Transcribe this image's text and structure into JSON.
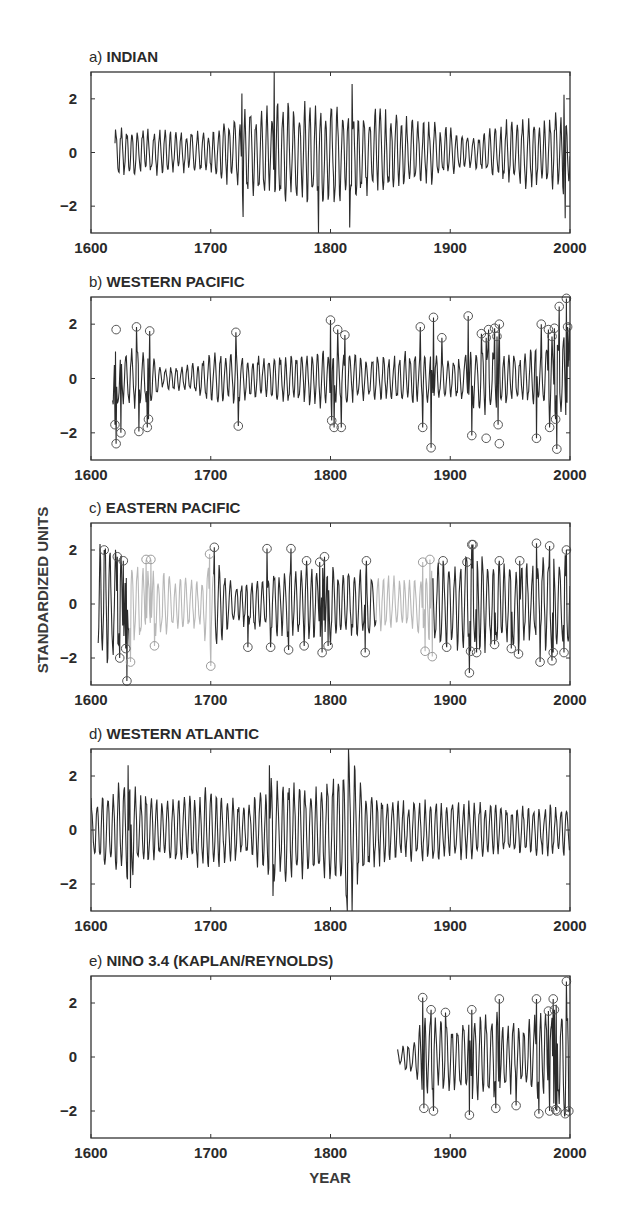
{
  "chart_data": {
    "type": "line",
    "ylabel": "STANDARDIZED UNITS",
    "xlabel": "YEAR",
    "xlim": [
      1600,
      2000
    ],
    "ylim": [
      -3,
      3
    ],
    "xticks": [
      1600,
      1700,
      1800,
      1900,
      2000
    ],
    "yticks": [
      -2,
      0,
      2
    ],
    "ytick_labels": [
      "−2",
      "0",
      "2"
    ],
    "grid": false,
    "panels": [
      {
        "id": "a",
        "prefix": "a)",
        "title": "INDIAN",
        "start_year": 1620,
        "end_year": 2000,
        "line_color": "#2b2b2b",
        "amplitude_profile": [
          [
            1620,
            1.0
          ],
          [
            1700,
            0.8
          ],
          [
            1725,
            1.6
          ],
          [
            1750,
            1.9
          ],
          [
            1790,
            2.1
          ],
          [
            1820,
            1.9
          ],
          [
            1880,
            1.3
          ],
          [
            1920,
            0.6
          ],
          [
            1945,
            1.3
          ],
          [
            2000,
            1.6
          ]
        ],
        "extremes_marked": [],
        "notable_points": [
          {
            "year": 1753,
            "value": 3.0
          },
          {
            "year": 1790,
            "value": -3.0
          },
          {
            "year": 1818,
            "value": 2.55
          },
          {
            "year": 1816,
            "value": -2.8
          },
          {
            "year": 1727,
            "value": -2.4
          },
          {
            "year": 1726,
            "value": 2.2
          },
          {
            "year": 1995,
            "value": 2.15
          },
          {
            "year": 1996,
            "value": -2.45
          }
        ]
      },
      {
        "id": "b",
        "prefix": "b)",
        "title": "WESTERN PACIFIC",
        "start_year": 1618,
        "end_year": 2000,
        "line_color": "#2b2b2b",
        "amplitude_profile": [
          [
            1618,
            1.3
          ],
          [
            1650,
            1.0
          ],
          [
            1660,
            0.4
          ],
          [
            1685,
            0.6
          ],
          [
            1700,
            1.0
          ],
          [
            1760,
            0.9
          ],
          [
            1800,
            1.2
          ],
          [
            1830,
            0.8
          ],
          [
            1870,
            1.1
          ],
          [
            1900,
            0.8
          ],
          [
            1930,
            1.4
          ],
          [
            1960,
            0.9
          ],
          [
            2000,
            2.0
          ]
        ],
        "extremes_marked": [
          {
            "year": 1621,
            "value": 1.8
          },
          {
            "year": 1620,
            "value": -1.7
          },
          {
            "year": 1621,
            "value": -2.4
          },
          {
            "year": 1625,
            "value": -2.0
          },
          {
            "year": 1638,
            "value": 1.9
          },
          {
            "year": 1640,
            "value": -1.95
          },
          {
            "year": 1647,
            "value": -1.8
          },
          {
            "year": 1648,
            "value": -1.5
          },
          {
            "year": 1649,
            "value": 1.75
          },
          {
            "year": 1721,
            "value": 1.7
          },
          {
            "year": 1723,
            "value": -1.75
          },
          {
            "year": 1800,
            "value": 2.15
          },
          {
            "year": 1801,
            "value": -1.55
          },
          {
            "year": 1803,
            "value": -1.8
          },
          {
            "year": 1806,
            "value": 1.8
          },
          {
            "year": 1809,
            "value": -1.8
          },
          {
            "year": 1812,
            "value": 1.6
          },
          {
            "year": 1875,
            "value": 1.9
          },
          {
            "year": 1877,
            "value": -1.8
          },
          {
            "year": 1884,
            "value": -2.55
          },
          {
            "year": 1886,
            "value": 2.25
          },
          {
            "year": 1893,
            "value": 1.5
          },
          {
            "year": 1915,
            "value": 2.3
          },
          {
            "year": 1918,
            "value": -2.1
          },
          {
            "year": 1926,
            "value": 1.65
          },
          {
            "year": 1930,
            "value": -2.2
          },
          {
            "year": 1930,
            "value": 1.5
          },
          {
            "year": 1932,
            "value": 1.8
          },
          {
            "year": 1937,
            "value": 1.85
          },
          {
            "year": 1939,
            "value": 1.55
          },
          {
            "year": 1940,
            "value": -1.7
          },
          {
            "year": 1941,
            "value": -2.4
          },
          {
            "year": 1941,
            "value": 2.0
          },
          {
            "year": 1972,
            "value": -2.2
          },
          {
            "year": 1976,
            "value": 2.0
          },
          {
            "year": 1982,
            "value": 1.8
          },
          {
            "year": 1983,
            "value": -1.8
          },
          {
            "year": 1985,
            "value": 1.55
          },
          {
            "year": 1987,
            "value": 1.85
          },
          {
            "year": 1988,
            "value": -1.5
          },
          {
            "year": 1989,
            "value": -2.6
          },
          {
            "year": 1991,
            "value": 2.65
          },
          {
            "year": 1997,
            "value": 2.95
          },
          {
            "year": 1998,
            "value": 1.9
          }
        ]
      },
      {
        "id": "c",
        "prefix": "c)",
        "title": "EASTERN PACIFIC",
        "start_year": 1606,
        "end_year": 2000,
        "line_color": "#2b2b2b",
        "gray_segments": [
          [
            1632,
            1702
          ],
          [
            1838,
            1885
          ]
        ],
        "gray_color": "#b8b8b8",
        "amplitude_profile": [
          [
            1606,
            2.5
          ],
          [
            1632,
            1.8
          ],
          [
            1660,
            1.2
          ],
          [
            1690,
            1.0
          ],
          [
            1702,
            2.0
          ],
          [
            1720,
            0.8
          ],
          [
            1760,
            1.4
          ],
          [
            1800,
            1.6
          ],
          [
            1830,
            1.3
          ],
          [
            1860,
            1.0
          ],
          [
            1885,
            1.6
          ],
          [
            1920,
            2.0
          ],
          [
            1960,
            1.6
          ],
          [
            2000,
            2.0
          ]
        ],
        "extremes_marked": [
          {
            "year": 1611,
            "value": 2.0
          },
          {
            "year": 1622,
            "value": 1.75
          },
          {
            "year": 1624,
            "value": -2.0
          },
          {
            "year": 1627,
            "value": 1.6
          },
          {
            "year": 1629,
            "value": -1.65
          },
          {
            "year": 1630,
            "value": -2.85
          },
          {
            "year": 1633,
            "value": -2.15
          },
          {
            "year": 1646,
            "value": 1.65
          },
          {
            "year": 1650,
            "value": 1.65
          },
          {
            "year": 1653,
            "value": -1.55
          },
          {
            "year": 1699,
            "value": 1.85
          },
          {
            "year": 1700,
            "value": -2.3
          },
          {
            "year": 1703,
            "value": 2.1
          },
          {
            "year": 1731,
            "value": -1.6
          },
          {
            "year": 1747,
            "value": 2.05
          },
          {
            "year": 1750,
            "value": -1.6
          },
          {
            "year": 1765,
            "value": -1.7
          },
          {
            "year": 1767,
            "value": 2.05
          },
          {
            "year": 1778,
            "value": -1.55
          },
          {
            "year": 1780,
            "value": 1.6
          },
          {
            "year": 1791,
            "value": 1.55
          },
          {
            "year": 1793,
            "value": -1.8
          },
          {
            "year": 1795,
            "value": 1.75
          },
          {
            "year": 1798,
            "value": -1.55
          },
          {
            "year": 1829,
            "value": -1.8
          },
          {
            "year": 1830,
            "value": 1.6
          },
          {
            "year": 1877,
            "value": 1.55
          },
          {
            "year": 1879,
            "value": -1.75
          },
          {
            "year": 1883,
            "value": 1.65
          },
          {
            "year": 1885,
            "value": -1.95
          },
          {
            "year": 1894,
            "value": 1.6
          },
          {
            "year": 1897,
            "value": -1.6
          },
          {
            "year": 1914,
            "value": 1.55
          },
          {
            "year": 1916,
            "value": -2.55
          },
          {
            "year": 1917,
            "value": -1.75
          },
          {
            "year": 1918,
            "value": 2.2
          },
          {
            "year": 1919,
            "value": 2.2
          },
          {
            "year": 1922,
            "value": -1.8
          },
          {
            "year": 1937,
            "value": -1.5
          },
          {
            "year": 1941,
            "value": 1.6
          },
          {
            "year": 1951,
            "value": -1.65
          },
          {
            "year": 1957,
            "value": -1.85
          },
          {
            "year": 1958,
            "value": 1.6
          },
          {
            "year": 1972,
            "value": 2.25
          },
          {
            "year": 1975,
            "value": -2.15
          },
          {
            "year": 1983,
            "value": 2.15
          },
          {
            "year": 1985,
            "value": -2.1
          },
          {
            "year": 1986,
            "value": -1.8
          },
          {
            "year": 1995,
            "value": -1.8
          },
          {
            "year": 1997,
            "value": 2.0
          }
        ]
      },
      {
        "id": "d",
        "prefix": "d)",
        "title": "WESTERN ATLANTIC",
        "start_year": 1600,
        "end_year": 2000,
        "line_color": "#2b2b2b",
        "amplitude_profile": [
          [
            1600,
            1.3
          ],
          [
            1630,
            2.1
          ],
          [
            1660,
            1.2
          ],
          [
            1700,
            1.7
          ],
          [
            1730,
            1.0
          ],
          [
            1750,
            2.0
          ],
          [
            1790,
            1.8
          ],
          [
            1815,
            3.0
          ],
          [
            1830,
            1.8
          ],
          [
            1850,
            1.2
          ],
          [
            1900,
            1.2
          ],
          [
            1950,
            1.0
          ],
          [
            2000,
            1.0
          ]
        ],
        "extremes_marked": [],
        "notable_points": [
          {
            "year": 1814,
            "value": -3.0
          },
          {
            "year": 1815,
            "value": 3.0
          },
          {
            "year": 1818,
            "value": -3.0
          },
          {
            "year": 1631,
            "value": 2.4
          },
          {
            "year": 1633,
            "value": -2.15
          },
          {
            "year": 1752,
            "value": -2.45
          },
          {
            "year": 1749,
            "value": 2.4
          }
        ]
      },
      {
        "id": "e",
        "prefix": "e)",
        "title": "NINO 3.4 (KAPLAN/REYNOLDS)",
        "start_year": 1856,
        "end_year": 2000,
        "line_color": "#2b2b2b",
        "amplitude_profile": [
          [
            1856,
            0.3
          ],
          [
            1870,
            0.8
          ],
          [
            1878,
            1.8
          ],
          [
            1900,
            1.3
          ],
          [
            1918,
            1.8
          ],
          [
            1940,
            1.7
          ],
          [
            1960,
            1.2
          ],
          [
            1975,
            1.9
          ],
          [
            2000,
            2.3
          ]
        ],
        "extremes_marked": [
          {
            "year": 1877,
            "value": 2.2
          },
          {
            "year": 1878,
            "value": -1.9
          },
          {
            "year": 1884,
            "value": 1.75
          },
          {
            "year": 1886,
            "value": -2.0
          },
          {
            "year": 1896,
            "value": 1.65
          },
          {
            "year": 1916,
            "value": -2.15
          },
          {
            "year": 1918,
            "value": 1.75
          },
          {
            "year": 1938,
            "value": -1.9
          },
          {
            "year": 1941,
            "value": 2.15
          },
          {
            "year": 1955,
            "value": -1.8
          },
          {
            "year": 1972,
            "value": 2.15
          },
          {
            "year": 1974,
            "value": -2.1
          },
          {
            "year": 1982,
            "value": 1.7
          },
          {
            "year": 1983,
            "value": -2.0
          },
          {
            "year": 1986,
            "value": 2.15
          },
          {
            "year": 1987,
            "value": 1.75
          },
          {
            "year": 1988,
            "value": -1.95
          },
          {
            "year": 1989,
            "value": -2.0
          },
          {
            "year": 1996,
            "value": -2.1
          },
          {
            "year": 1997,
            "value": 2.8
          },
          {
            "year": 1999,
            "value": -2.0
          }
        ]
      }
    ]
  }
}
